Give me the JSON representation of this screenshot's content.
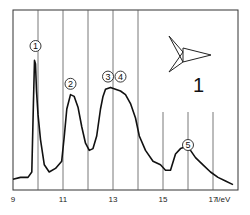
{
  "chart_data": {
    "type": "line",
    "title": "",
    "xlabel": "I/eV",
    "ylabel": "",
    "xlim": [
      9,
      18
    ],
    "ylim": [
      0,
      1
    ],
    "grid": "vertical lines at integer eV",
    "x_ticks": [
      "9",
      "11",
      "13",
      "15",
      "17"
    ],
    "x_tick_values": [
      9,
      11,
      13,
      15,
      17
    ],
    "compound_label": "1",
    "peak_labels": [
      {
        "text": "1",
        "x": 9.9,
        "y": 0.8
      },
      {
        "text": "2",
        "x": 11.3,
        "y": 0.59
      },
      {
        "text": "3",
        "x": 12.8,
        "y": 0.63
      },
      {
        "text": "4",
        "x": 13.3,
        "y": 0.63
      },
      {
        "text": "5",
        "x": 16.0,
        "y": 0.25
      }
    ],
    "series": [
      {
        "name": "photoelectron spectrum",
        "x": [
          9.0,
          9.3,
          9.6,
          9.75,
          9.82,
          9.86,
          9.9,
          9.94,
          10.0,
          10.1,
          10.25,
          10.45,
          10.7,
          10.95,
          11.05,
          11.15,
          11.3,
          11.45,
          11.6,
          11.75,
          11.9,
          12.05,
          12.2,
          12.35,
          12.5,
          12.6,
          12.7,
          12.9,
          13.1,
          13.3,
          13.5,
          13.7,
          13.9,
          14.05,
          14.3,
          14.6,
          14.9,
          15.1,
          15.3,
          15.5,
          15.7,
          15.9,
          16.1,
          16.3,
          16.6,
          16.9,
          17.2,
          17.5,
          17.8
        ],
        "y": [
          0.06,
          0.07,
          0.07,
          0.1,
          0.5,
          0.72,
          0.7,
          0.55,
          0.42,
          0.28,
          0.14,
          0.1,
          0.12,
          0.16,
          0.3,
          0.45,
          0.53,
          0.52,
          0.46,
          0.35,
          0.26,
          0.22,
          0.23,
          0.3,
          0.45,
          0.52,
          0.56,
          0.57,
          0.56,
          0.55,
          0.53,
          0.48,
          0.4,
          0.3,
          0.22,
          0.16,
          0.14,
          0.11,
          0.11,
          0.2,
          0.23,
          0.24,
          0.22,
          0.18,
          0.14,
          0.1,
          0.07,
          0.05,
          0.03
        ]
      }
    ],
    "legend": null
  }
}
